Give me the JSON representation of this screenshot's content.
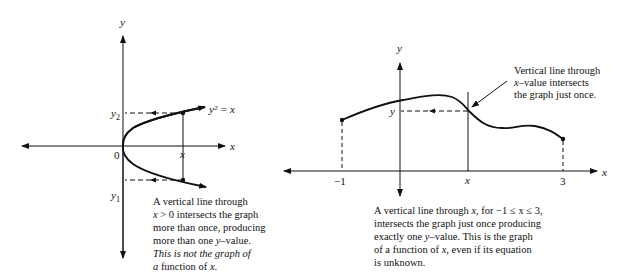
{
  "left_figure": {
    "axis_y_label": "y",
    "axis_x_label": "x",
    "origin_label": "0",
    "curve_label": "y² = x",
    "y2_label": "y",
    "y2_sub": "2",
    "y1_label": "y",
    "y1_sub": "1",
    "x_tick_label": "x",
    "caption": {
      "line1": "A vertical line through",
      "line2_var": "x",
      "line2_rest": " > 0 intersects the graph",
      "line3": "more than once, producing",
      "line4_pre": "more than one ",
      "line4_var": "y",
      "line4_post": "–value.",
      "line5": "This is not the graph of",
      "line6_italic": "a",
      "line6_rest": " function of ",
      "line6_var": "x",
      "line6_end": "."
    }
  },
  "right_figure": {
    "axis_y_label": "y",
    "axis_x_label": "x",
    "tick_left": "−1",
    "tick_mid": "x",
    "tick_right": "3",
    "y_value_label": "y",
    "annotation": {
      "line1": "Vertical line through",
      "line2_var": "x",
      "line2_rest": "–value intersects",
      "line3": "the graph just once."
    },
    "caption": {
      "line1_pre": "A vertical line through ",
      "line1_var": "x",
      "line1_post": ", for −1 ≤ x ≤ 3,",
      "line2": "intersects the graph just once producing",
      "line3_pre": "exactly one ",
      "line3_var": "y",
      "line3_post": "–value. This is the graph",
      "line4_pre": "of a function of ",
      "line4_var": "x",
      "line4_post": ", even if its equation",
      "line5": "is unknown."
    }
  }
}
